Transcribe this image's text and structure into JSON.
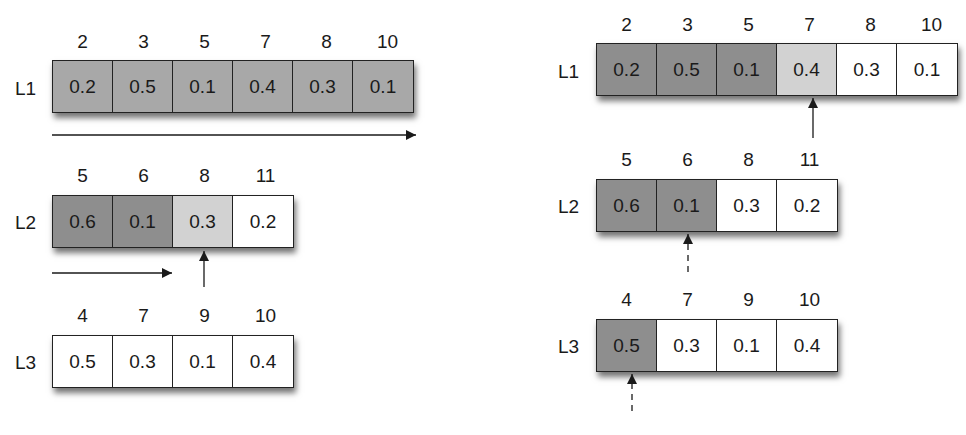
{
  "left_panel": {
    "lists": [
      {
        "label": "L1",
        "headers": [
          "2",
          "3",
          "5",
          "7",
          "8",
          "10"
        ],
        "values": [
          "0.2",
          "0.5",
          "0.1",
          "0.4",
          "0.3",
          "0.1"
        ],
        "shades": [
          "gray",
          "gray",
          "gray",
          "gray",
          "gray",
          "gray"
        ]
      },
      {
        "label": "L2",
        "headers": [
          "5",
          "6",
          "8",
          "11"
        ],
        "values": [
          "0.6",
          "0.1",
          "0.3",
          "0.2"
        ],
        "shades": [
          "dark",
          "dark",
          "light",
          "white"
        ]
      },
      {
        "label": "L3",
        "headers": [
          "4",
          "7",
          "9",
          "10"
        ],
        "values": [
          "0.5",
          "0.3",
          "0.1",
          "0.4"
        ],
        "shades": [
          "white",
          "white",
          "white",
          "white"
        ]
      }
    ],
    "arrows": [
      {
        "type": "horizontal",
        "list": "L1",
        "extent": "full"
      },
      {
        "type": "horizontal",
        "list": "L2",
        "extent": "to cell 8"
      },
      {
        "type": "pointer-up",
        "list": "L2",
        "target_cell": "8",
        "style": "solid"
      }
    ]
  },
  "right_panel": {
    "lists": [
      {
        "label": "L1",
        "headers": [
          "2",
          "3",
          "5",
          "7",
          "8",
          "10"
        ],
        "values": [
          "0.2",
          "0.5",
          "0.1",
          "0.4",
          "0.3",
          "0.1"
        ],
        "shades": [
          "dark",
          "dark",
          "dark",
          "light",
          "white",
          "white"
        ]
      },
      {
        "label": "L2",
        "headers": [
          "5",
          "6",
          "8",
          "11"
        ],
        "values": [
          "0.6",
          "0.1",
          "0.3",
          "0.2"
        ],
        "shades": [
          "dark",
          "dark",
          "white",
          "white"
        ]
      },
      {
        "label": "L3",
        "headers": [
          "4",
          "7",
          "9",
          "10"
        ],
        "values": [
          "0.5",
          "0.3",
          "0.1",
          "0.4"
        ],
        "shades": [
          "dark",
          "white",
          "white",
          "white"
        ]
      }
    ],
    "arrows": [
      {
        "type": "pointer-up",
        "list": "L1",
        "target_cell": "7",
        "style": "solid"
      },
      {
        "type": "pointer-up",
        "list": "L2",
        "target_cell": "6",
        "style": "dashed"
      },
      {
        "type": "pointer-up",
        "list": "L3",
        "target_cell": "4",
        "style": "dashed"
      }
    ]
  },
  "colors": {
    "gray": "#a8a8a8",
    "dark": "#8e8e8e",
    "light": "#d2d2d2",
    "white": "#ffffff",
    "stroke": "#222222"
  }
}
